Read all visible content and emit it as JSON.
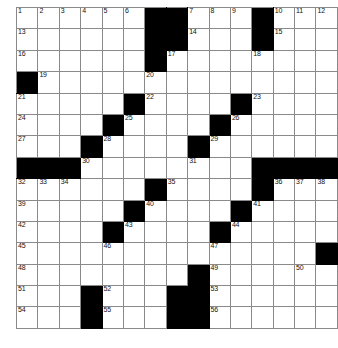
{
  "puzzle": {
    "kind": "crossword-grid",
    "columns": 15,
    "rows": 15,
    "colors": {
      "block": "#000000",
      "cell": "#ffffff",
      "gridline": "#8a8a8a",
      "number": "#111111",
      "page_background": "#ffffff"
    },
    "numbers_total": 56,
    "grid": [
      [
        {
          "n": "1"
        },
        {
          "n": "2"
        },
        {
          "n": "3"
        },
        {
          "n": "4"
        },
        {
          "n": "5"
        },
        {
          "n": "6"
        },
        {
          "b": true
        },
        {
          "b": true
        },
        {
          "n": "7"
        },
        {
          "n": "8"
        },
        {
          "n": "9"
        },
        {
          "b": true
        },
        {
          "n": "10"
        },
        {
          "n": "11"
        },
        {
          "n": "12"
        }
      ],
      [
        {
          "n": "13"
        },
        {},
        {},
        {},
        {},
        {},
        {
          "b": true
        },
        {
          "b": true
        },
        {
          "n": "14"
        },
        {},
        {},
        {
          "b": true
        },
        {
          "n": "15"
        },
        {},
        {}
      ],
      [
        {
          "n": "16"
        },
        {},
        {},
        {},
        {},
        {},
        {
          "b": true
        },
        {
          "n": "17"
        },
        {},
        {},
        {},
        {
          "n": "18"
        },
        {},
        {},
        {}
      ],
      [
        {
          "b": true
        },
        {
          "n": "19"
        },
        {},
        {},
        {},
        {},
        {
          "n": "20"
        },
        {},
        {},
        {},
        {},
        {},
        {},
        {},
        {}
      ],
      [
        {
          "n": "21"
        },
        {},
        {},
        {},
        {},
        {
          "b": true
        },
        {
          "n": "22"
        },
        {},
        {},
        {},
        {
          "b": true
        },
        {
          "n": "23"
        },
        {},
        {},
        {}
      ],
      [
        {
          "n": "24"
        },
        {},
        {},
        {},
        {
          "b": true
        },
        {
          "n": "25"
        },
        {},
        {},
        {},
        {
          "b": true
        },
        {
          "n": "26"
        },
        {},
        {},
        {},
        {}
      ],
      [
        {
          "n": "27"
        },
        {},
        {},
        {
          "b": true
        },
        {
          "n": "28"
        },
        {},
        {},
        {},
        {
          "b": true
        },
        {
          "n": "29"
        },
        {},
        {},
        {},
        {},
        {}
      ],
      [
        {
          "b": true
        },
        {
          "b": true
        },
        {
          "b": true
        },
        {
          "n": "30"
        },
        {},
        {},
        {},
        {},
        {
          "n": "31"
        },
        {},
        {},
        {
          "b": true
        },
        {
          "b": true
        },
        {
          "b": true
        },
        {
          "b": true
        }
      ],
      [
        {
          "n": "32"
        },
        {
          "n": "33"
        },
        {
          "n": "34"
        },
        {},
        {},
        {},
        {
          "b": true
        },
        {
          "n": "35"
        },
        {},
        {},
        {},
        {
          "b": true
        },
        {
          "n": "36"
        },
        {
          "n": "37"
        },
        {
          "n": "38"
        }
      ],
      [
        {
          "n": "39"
        },
        {},
        {},
        {},
        {},
        {
          "b": true
        },
        {
          "n": "40"
        },
        {},
        {},
        {},
        {
          "b": true
        },
        {
          "n": "41"
        },
        {},
        {},
        {}
      ],
      [
        {
          "n": "42"
        },
        {},
        {},
        {},
        {
          "b": true
        },
        {
          "n": "43"
        },
        {},
        {},
        {},
        {
          "b": true
        },
        {
          "n": "44"
        },
        {},
        {},
        {},
        {}
      ],
      [
        {
          "n": "45"
        },
        {},
        {},
        {},
        {
          "n": "46"
        },
        {},
        {},
        {},
        {},
        {
          "n": "47"
        },
        {},
        {},
        {},
        {},
        {
          "b": true
        }
      ],
      [
        {
          "n": "48"
        },
        {},
        {},
        {},
        {},
        {},
        {},
        {},
        {
          "b": true
        },
        {
          "n": "49"
        },
        {},
        {},
        {},
        {
          "n": "50"
        },
        {}
      ],
      [
        {
          "n": "51"
        },
        {},
        {},
        {
          "b": true
        },
        {
          "n": "52"
        },
        {},
        {},
        {
          "b": true
        },
        {
          "b": true
        },
        {
          "n": "53"
        },
        {},
        {},
        {},
        {},
        {}
      ],
      [
        {
          "n": "54"
        },
        {},
        {},
        {
          "b": true
        },
        {
          "n": "55"
        },
        {},
        {},
        {
          "b": true
        },
        {
          "b": true
        },
        {
          "n": "56"
        },
        {},
        {},
        {},
        {},
        {}
      ]
    ]
  }
}
